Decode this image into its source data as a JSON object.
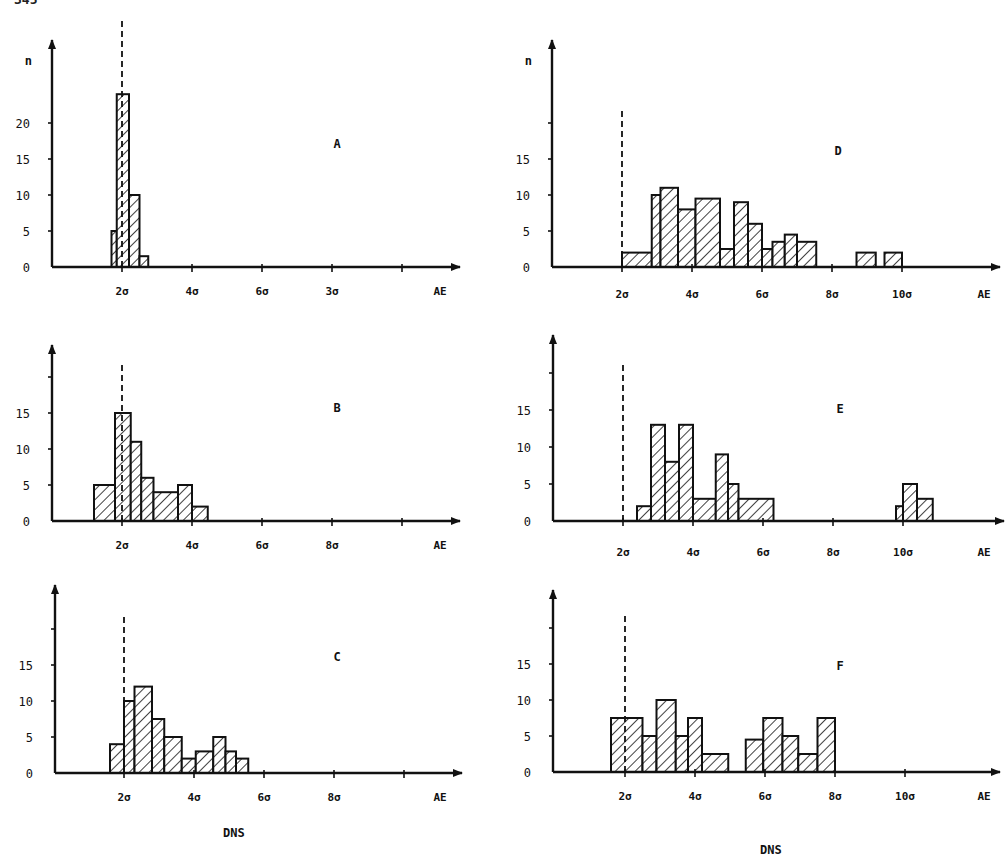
{
  "page": {
    "page_number_partial": "345",
    "footer_left": "DNS",
    "footer_right": "DNS"
  },
  "chart_data": [
    {
      "id": "A",
      "type": "bar",
      "subtype": "histogram",
      "panel_label": "A",
      "ylabel": "n",
      "xlabel": "AE",
      "x_unit": "σ",
      "y_ticks": [
        0,
        5,
        10,
        15,
        20
      ],
      "y_tick_labels": [
        "0",
        "5",
        "10",
        "15",
        "20"
      ],
      "x_ticks": [
        2,
        4,
        6,
        8,
        10
      ],
      "x_tick_labels": [
        "2σ",
        "4σ",
        "6σ",
        "3σ",
        ""
      ],
      "threshold_line_x": 2.0,
      "ylim": [
        0,
        27
      ],
      "xlim": [
        0,
        11.5
      ],
      "bins": [
        {
          "from": 1.7,
          "to": 1.85,
          "n": 5
        },
        {
          "from": 1.85,
          "to": 2.2,
          "n": 24
        },
        {
          "from": 2.2,
          "to": 2.5,
          "n": 10
        },
        {
          "from": 2.5,
          "to": 2.75,
          "n": 1.5
        }
      ]
    },
    {
      "id": "B",
      "type": "bar",
      "subtype": "histogram",
      "panel_label": "B",
      "ylabel": "",
      "xlabel": "AE",
      "x_unit": "σ",
      "y_ticks": [
        0,
        5,
        10,
        15,
        20
      ],
      "y_tick_labels": [
        "0",
        "5",
        "10",
        "15",
        ""
      ],
      "x_ticks": [
        2,
        4,
        6,
        8,
        10
      ],
      "x_tick_labels": [
        "2σ",
        "4σ",
        "6σ",
        "8σ",
        ""
      ],
      "threshold_line_x": 2.0,
      "ylim": [
        0,
        24
      ],
      "xlim": [
        0,
        11.5
      ],
      "bins": [
        {
          "from": 1.2,
          "to": 1.8,
          "n": 5
        },
        {
          "from": 1.8,
          "to": 2.25,
          "n": 15
        },
        {
          "from": 2.25,
          "to": 2.55,
          "n": 11
        },
        {
          "from": 2.55,
          "to": 2.9,
          "n": 6
        },
        {
          "from": 2.9,
          "to": 3.6,
          "n": 4
        },
        {
          "from": 3.6,
          "to": 4.0,
          "n": 5
        },
        {
          "from": 4.0,
          "to": 4.45,
          "n": 2
        }
      ]
    },
    {
      "id": "C",
      "type": "bar",
      "subtype": "histogram",
      "panel_label": "C",
      "ylabel": "",
      "xlabel": "AE",
      "x_unit": "σ",
      "y_ticks": [
        0,
        5,
        10,
        15,
        20
      ],
      "y_tick_labels": [
        "0",
        "5",
        "10",
        "15",
        ""
      ],
      "x_ticks": [
        2,
        4,
        6,
        8,
        10
      ],
      "x_tick_labels": [
        "2σ",
        "4σ",
        "6σ",
        "8σ",
        ""
      ],
      "threshold_line_x": 2.0,
      "ylim": [
        0,
        24
      ],
      "xlim": [
        0,
        11.5
      ],
      "bins": [
        {
          "from": 1.6,
          "to": 2.0,
          "n": 4
        },
        {
          "from": 2.0,
          "to": 2.3,
          "n": 10
        },
        {
          "from": 2.3,
          "to": 2.8,
          "n": 12
        },
        {
          "from": 2.8,
          "to": 3.15,
          "n": 7.5
        },
        {
          "from": 3.15,
          "to": 3.65,
          "n": 5
        },
        {
          "from": 3.65,
          "to": 4.05,
          "n": 2
        },
        {
          "from": 4.05,
          "to": 4.55,
          "n": 3
        },
        {
          "from": 4.55,
          "to": 4.9,
          "n": 5
        },
        {
          "from": 4.9,
          "to": 5.2,
          "n": 3
        },
        {
          "from": 5.2,
          "to": 5.55,
          "n": 2
        }
      ]
    },
    {
      "id": "D",
      "type": "bar",
      "subtype": "histogram",
      "panel_label": "D",
      "ylabel": "n",
      "xlabel": "AE",
      "x_unit": "σ",
      "y_ticks": [
        0,
        5,
        10,
        15,
        20
      ],
      "y_tick_labels": [
        "0",
        "5",
        "10",
        "15",
        ""
      ],
      "x_ticks": [
        2,
        4,
        6,
        8,
        10
      ],
      "x_tick_labels": [
        "2σ",
        "4σ",
        "6σ",
        "8σ",
        "10σ"
      ],
      "threshold_line_x": 2.0,
      "ylim": [
        0,
        31
      ],
      "xlim": [
        0,
        12.8
      ],
      "bins": [
        {
          "from": 2.0,
          "to": 2.85,
          "n": 2
        },
        {
          "from": 2.85,
          "to": 3.1,
          "n": 10
        },
        {
          "from": 3.1,
          "to": 3.6,
          "n": 11
        },
        {
          "from": 3.6,
          "to": 4.1,
          "n": 8
        },
        {
          "from": 4.1,
          "to": 4.8,
          "n": 9.5
        },
        {
          "from": 4.8,
          "to": 5.2,
          "n": 2.5
        },
        {
          "from": 5.2,
          "to": 5.6,
          "n": 9
        },
        {
          "from": 5.6,
          "to": 6.0,
          "n": 6
        },
        {
          "from": 6.0,
          "to": 6.3,
          "n": 2.5
        },
        {
          "from": 6.3,
          "to": 6.65,
          "n": 3.5
        },
        {
          "from": 6.65,
          "to": 7.0,
          "n": 4.5
        },
        {
          "from": 7.0,
          "to": 7.55,
          "n": 3.5
        },
        {
          "from": 8.7,
          "to": 9.25,
          "n": 2
        },
        {
          "from": 9.5,
          "to": 10.0,
          "n": 2
        }
      ]
    },
    {
      "id": "E",
      "type": "bar",
      "subtype": "histogram",
      "panel_label": "E",
      "ylabel": "",
      "xlabel": "AE",
      "x_unit": "σ",
      "y_ticks": [
        0,
        5,
        10,
        15,
        20
      ],
      "y_tick_labels": [
        "0",
        "5",
        "10",
        "15",
        ""
      ],
      "x_ticks": [
        2,
        4,
        6,
        8,
        10
      ],
      "x_tick_labels": [
        "2σ",
        "4σ",
        "6σ",
        "8σ",
        "10σ"
      ],
      "threshold_line_x": 2.0,
      "ylim": [
        0,
        25
      ],
      "xlim": [
        0,
        12.8
      ],
      "bins": [
        {
          "from": 2.4,
          "to": 2.8,
          "n": 2
        },
        {
          "from": 2.8,
          "to": 3.2,
          "n": 13
        },
        {
          "from": 3.2,
          "to": 3.6,
          "n": 8
        },
        {
          "from": 3.6,
          "to": 4.0,
          "n": 13
        },
        {
          "from": 4.0,
          "to": 4.65,
          "n": 3
        },
        {
          "from": 4.65,
          "to": 5.0,
          "n": 9
        },
        {
          "from": 5.0,
          "to": 5.3,
          "n": 5
        },
        {
          "from": 5.3,
          "to": 6.3,
          "n": 3
        },
        {
          "from": 9.8,
          "to": 10.0,
          "n": 2
        },
        {
          "from": 10.0,
          "to": 10.4,
          "n": 5
        },
        {
          "from": 10.4,
          "to": 10.85,
          "n": 3
        }
      ]
    },
    {
      "id": "F",
      "type": "bar",
      "subtype": "histogram",
      "panel_label": "F",
      "ylabel": "",
      "xlabel": "AE",
      "x_unit": "σ",
      "y_ticks": [
        0,
        5,
        10,
        15,
        20
      ],
      "y_tick_labels": [
        "0",
        "5",
        "10",
        "15",
        ""
      ],
      "x_ticks": [
        2,
        4,
        6,
        8,
        10
      ],
      "x_tick_labels": [
        "2σ",
        "4σ",
        "6σ",
        "8σ",
        "10σ"
      ],
      "threshold_line_x": 2.0,
      "ylim": [
        0,
        24
      ],
      "xlim": [
        0,
        12.8
      ],
      "bins": [
        {
          "from": 1.6,
          "to": 2.5,
          "n": 7.5
        },
        {
          "from": 2.5,
          "to": 2.9,
          "n": 5
        },
        {
          "from": 2.9,
          "to": 3.45,
          "n": 10
        },
        {
          "from": 3.45,
          "to": 3.8,
          "n": 5
        },
        {
          "from": 3.8,
          "to": 4.2,
          "n": 7.5
        },
        {
          "from": 4.2,
          "to": 4.95,
          "n": 2.5
        },
        {
          "from": 5.45,
          "to": 5.95,
          "n": 4.5
        },
        {
          "from": 5.95,
          "to": 6.5,
          "n": 7.5
        },
        {
          "from": 6.5,
          "to": 6.95,
          "n": 5
        },
        {
          "from": 6.95,
          "to": 7.5,
          "n": 2.5
        },
        {
          "from": 7.5,
          "to": 8.0,
          "n": 7.5
        }
      ]
    }
  ],
  "layout": {
    "panels": {
      "A": {
        "axis_x": 52,
        "base_y": 267,
        "top_y": 40,
        "end_x": 460,
        "px_per_sigma": 35,
        "origin_x": 52,
        "sigma0_x": 52,
        "two_sigma_x": 122,
        "px_per_n": 7.2,
        "label_x": 337,
        "label_y": 148,
        "tick_label_y": 295,
        "ae_x": 440
      },
      "B": {
        "axis_x": 52,
        "base_y": 521,
        "top_y": 345,
        "end_x": 460,
        "px_per_sigma": 35,
        "two_sigma_x": 122,
        "px_per_n": 7.2,
        "label_x": 337,
        "label_y": 412,
        "tick_label_y": 549,
        "ae_x": 440
      },
      "C": {
        "axis_x": 55,
        "base_y": 773,
        "top_y": 585,
        "end_x": 462,
        "px_per_sigma": 35,
        "two_sigma_x": 124,
        "px_per_n": 7.2,
        "label_x": 337,
        "label_y": 661,
        "tick_label_y": 801,
        "ae_x": 440
      },
      "D": {
        "axis_x": 552,
        "base_y": 267,
        "top_y": 40,
        "end_x": 1000,
        "px_per_sigma": 35,
        "two_sigma_x": 622,
        "px_per_n": 7.2,
        "label_x": 838,
        "label_y": 155,
        "tick_label_y": 298,
        "ae_x": 984
      },
      "E": {
        "axis_x": 553,
        "base_y": 521,
        "top_y": 335,
        "end_x": 1004,
        "px_per_sigma": 35,
        "two_sigma_x": 623,
        "px_per_n": 7.4,
        "label_x": 840,
        "label_y": 413,
        "tick_label_y": 556,
        "ae_x": 984
      },
      "F": {
        "axis_x": 553,
        "base_y": 772,
        "top_y": 590,
        "end_x": 1000,
        "px_per_sigma": 35,
        "two_sigma_x": 625,
        "px_per_n": 7.2,
        "label_x": 840,
        "label_y": 670,
        "tick_label_y": 800,
        "ae_x": 984
      }
    },
    "dns_left": {
      "x": 235,
      "y": 840
    },
    "dns_right": {
      "x": 772,
      "y": 857
    }
  }
}
